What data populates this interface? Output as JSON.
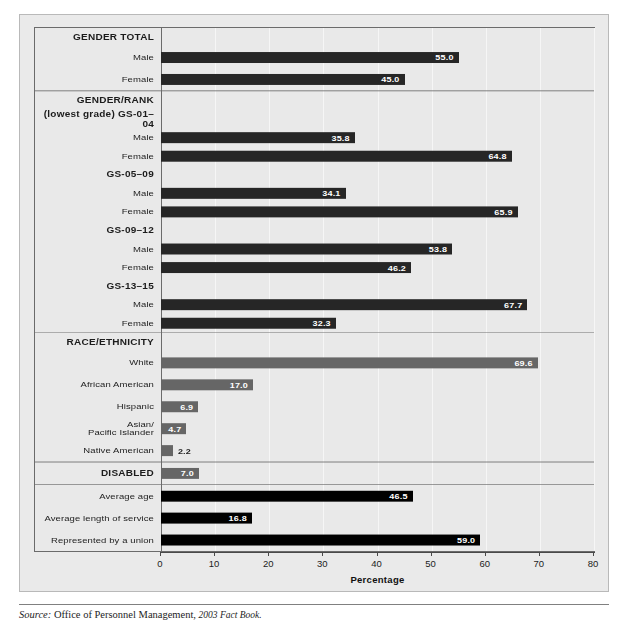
{
  "axis": {
    "title": "Percentage",
    "ticks": [
      0,
      10,
      20,
      30,
      40,
      50,
      60,
      70,
      80
    ],
    "tick_labels": [
      "0",
      "10",
      "20",
      "30",
      "40",
      "50",
      "60",
      "70",
      "80"
    ]
  },
  "source": {
    "lead": "Source:",
    "text": " Office of Personnel Management, ",
    "publication": "2003 Fact Book."
  },
  "sections": [
    {
      "id": "gender-total",
      "heading": "GENDER TOTAL",
      "rows": [
        {
          "label": "Male",
          "value": "55.0",
          "v": 55.0,
          "style": "dark"
        },
        {
          "label": "Female",
          "value": "45.0",
          "v": 45.0,
          "style": "dark"
        }
      ]
    },
    {
      "id": "gender-rank",
      "heading": "GENDER/RANK",
      "subheading": "(lowest grade) GS-01–04",
      "groups": [
        {
          "name": "GS-01–04",
          "rows": [
            {
              "label": "Male",
              "value": "35.8",
              "v": 35.8,
              "style": "dark"
            },
            {
              "label": "Female",
              "value": "64.8",
              "v": 64.8,
              "style": "dark"
            }
          ]
        },
        {
          "name": "GS-05–09",
          "rows": [
            {
              "label": "Male",
              "value": "34.1",
              "v": 34.1,
              "style": "dark"
            },
            {
              "label": "Female",
              "value": "65.9",
              "v": 65.9,
              "style": "dark"
            }
          ]
        },
        {
          "name": "GS-09–12",
          "rows": [
            {
              "label": "Male",
              "value": "53.8",
              "v": 53.8,
              "style": "dark"
            },
            {
              "label": "Female",
              "value": "46.2",
              "v": 46.2,
              "style": "dark"
            }
          ]
        },
        {
          "name": "GS-13–15",
          "rows": [
            {
              "label": "Male",
              "value": "67.7",
              "v": 67.7,
              "style": "dark"
            },
            {
              "label": "Female",
              "value": "32.3",
              "v": 32.3,
              "style": "dark"
            }
          ]
        }
      ]
    },
    {
      "id": "race-ethnicity",
      "heading": "RACE/ETHNICITY",
      "rows": [
        {
          "label": "White",
          "value": "69.6",
          "v": 69.6,
          "style": "gray"
        },
        {
          "label": "African American",
          "value": "17.0",
          "v": 17.0,
          "style": "gray"
        },
        {
          "label": "Hispanic",
          "value": "6.9",
          "v": 6.9,
          "style": "gray"
        },
        {
          "label": "Asian/\nPacific Islander",
          "value": "4.7",
          "v": 4.7,
          "style": "gray"
        },
        {
          "label": "Native American",
          "value": "2.2",
          "v": 2.2,
          "style": "gray",
          "outside": true
        }
      ]
    },
    {
      "id": "disabled",
      "heading": "DISABLED",
      "heading_value": "7.0",
      "heading_v": 7.0,
      "heading_style": "gray"
    },
    {
      "id": "other-measures",
      "rows": [
        {
          "label": "Average age",
          "value": "46.5",
          "v": 46.5,
          "style": "black"
        },
        {
          "label": "Average length of service",
          "value": "16.8",
          "v": 16.8,
          "style": "black"
        },
        {
          "label": "Represented by a union",
          "value": "59.0",
          "v": 59.0,
          "style": "black"
        }
      ]
    }
  ],
  "chart_data": {
    "type": "bar",
    "orientation": "horizontal",
    "title": "",
    "xlabel": "Percentage",
    "ylabel": "",
    "xlim": [
      0,
      80
    ],
    "xticks": [
      0,
      10,
      20,
      30,
      40,
      50,
      60,
      70,
      80
    ],
    "grid": true,
    "legend": "none",
    "categories": [
      "GENDER TOTAL: Male",
      "GENDER TOTAL: Female",
      "GS-01–04: Male",
      "GS-01–04: Female",
      "GS-05–09: Male",
      "GS-05–09: Female",
      "GS-09–12: Male",
      "GS-09–12: Female",
      "GS-13–15: Male",
      "GS-13–15: Female",
      "White",
      "African American",
      "Hispanic",
      "Asian/Pacific Islander",
      "Native American",
      "DISABLED",
      "Average age",
      "Average length of service",
      "Represented by a union"
    ],
    "values": [
      55.0,
      45.0,
      35.8,
      64.8,
      34.1,
      65.9,
      53.8,
      46.2,
      67.7,
      32.3,
      69.6,
      17.0,
      6.9,
      4.7,
      2.2,
      7.0,
      46.5,
      16.8,
      59.0
    ],
    "groups": [
      {
        "name": "GENDER TOTAL",
        "categories": [
          "Male",
          "Female"
        ],
        "values": [
          55.0,
          45.0
        ]
      },
      {
        "name": "GENDER/RANK (lowest grade) GS-01–04",
        "categories": [
          "Male",
          "Female"
        ],
        "values": [
          35.8,
          64.8
        ]
      },
      {
        "name": "GS-05–09",
        "categories": [
          "Male",
          "Female"
        ],
        "values": [
          34.1,
          65.9
        ]
      },
      {
        "name": "GS-09–12",
        "categories": [
          "Male",
          "Female"
        ],
        "values": [
          53.8,
          46.2
        ]
      },
      {
        "name": "GS-13–15",
        "categories": [
          "Male",
          "Female"
        ],
        "values": [
          67.7,
          32.3
        ]
      },
      {
        "name": "RACE/ETHNICITY",
        "categories": [
          "White",
          "African American",
          "Hispanic",
          "Asian/Pacific Islander",
          "Native American"
        ],
        "values": [
          69.6,
          17.0,
          6.9,
          4.7,
          2.2
        ]
      },
      {
        "name": "DISABLED",
        "categories": [
          "DISABLED"
        ],
        "values": [
          7.0
        ]
      },
      {
        "name": "OTHER",
        "categories": [
          "Average age",
          "Average length of service",
          "Represented by a union"
        ],
        "values": [
          46.5,
          16.8,
          59.0
        ]
      }
    ],
    "source": "Office of Personnel Management, 2003 Fact Book."
  }
}
